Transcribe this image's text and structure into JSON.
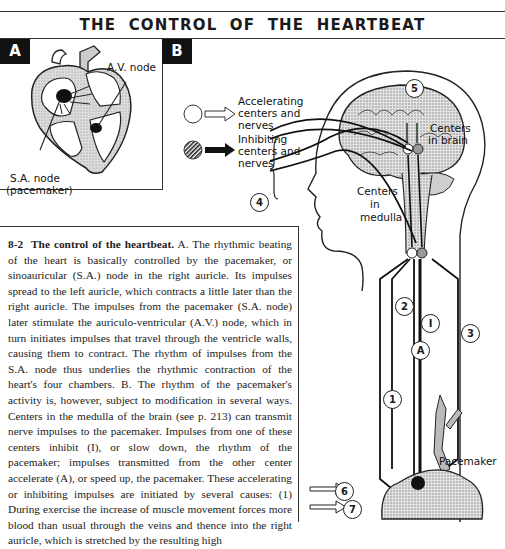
{
  "figure": {
    "title": "THE CONTROL OF THE HEARTBEAT",
    "panel_a": {
      "tag": "A",
      "labels": {
        "av_node": "A.V. node",
        "sa_node": "S.A. node",
        "sa_node_note": "(pacemaker)"
      }
    },
    "panel_b": {
      "tag": "B",
      "legend": [
        {
          "symbol": "open-circle-open-arrow",
          "lines": [
            "Accelerating",
            "centers and",
            "nerves"
          ]
        },
        {
          "symbol": "hatched-circle-solid-arrow",
          "lines": [
            "Inhibiting",
            "centers and",
            "nerves"
          ]
        }
      ],
      "labels": {
        "centers_in_brain": [
          "Centers",
          "in brain"
        ],
        "centers_in_medulla": [
          "Centers",
          "in",
          "medulla"
        ],
        "pacemaker": "Pacemaker"
      },
      "markers": {
        "m1a": "1",
        "m1b": "1",
        "m2": "2",
        "m3": "3",
        "m4": "4",
        "m5": "5",
        "m6": "6",
        "m7": "7",
        "inhibit": "I",
        "accelerate": "A"
      }
    }
  },
  "caption": {
    "number": "8-2",
    "heading": "The control of the heartbeat.",
    "body": "A. The rhythmic beating of the heart is basically controlled by the pacemaker, or sinoauricular (S.A.) node in the right auricle. Its impulses spread to the left auricle, which contracts a little later than the right auricle. The impulses from the pacemaker (S.A. node) later stimulate the auriculo-ventricular (A.V.) node, which in turn initiates impulses that travel through the ventricle walls, causing them to contract. The rhythm of impulses from the S.A. node thus underlies the rhythmic contraction of the heart's four chambers. B. The rhythm of the pacemaker's activity is, however, subject to modification in several ways. Centers in the medulla of the brain (see p. 213) can transmit nerve impulses to the pacemaker. Impulses from one of these centers inhibit (I), or slow down, the rhythm of the pacemaker; impulses transmitted from the other center accelerate (A), or speed up, the pacemaker. These accelerating or inhibiting impulses are initiated by several causes: (1) During exercise the increase of muscle movement forces more blood than usual through the veins and thence into the right auricle, which is stretched by the resulting high"
  }
}
